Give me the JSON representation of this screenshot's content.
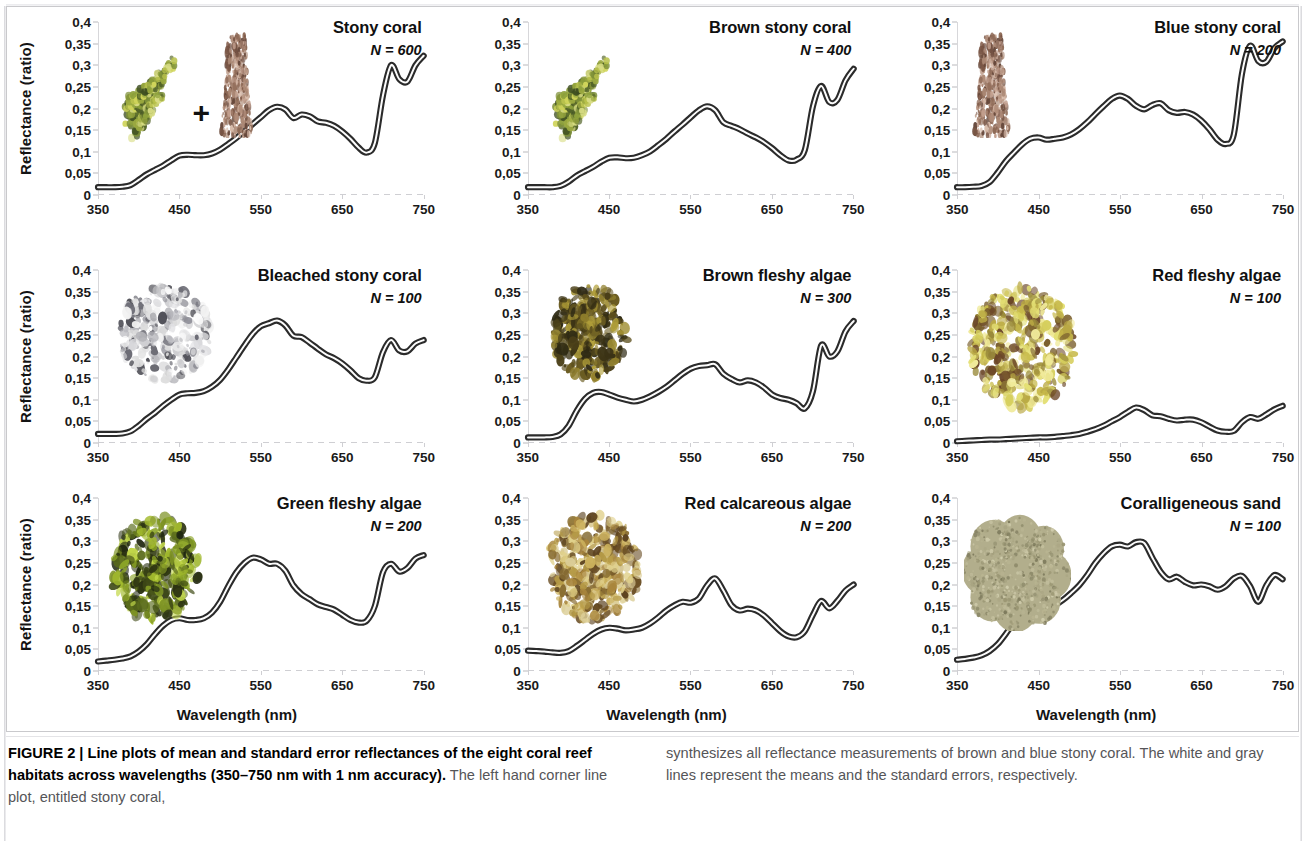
{
  "figure": {
    "axis": {
      "ylabel": "Reflectance (ratio)",
      "xlabel": "Wavelength (nm)",
      "yticks": [
        "0",
        "0,05",
        "0,1",
        "0,15",
        "0,2",
        "0,25",
        "0,3",
        "0,35",
        "0,4"
      ],
      "xticks": [
        "350",
        "450",
        "550",
        "650",
        "750"
      ],
      "ylim": [
        0,
        0.4
      ],
      "xlim": [
        350,
        750
      ]
    },
    "panels": [
      {
        "id": "stony-coral",
        "title": "Stony coral",
        "n_label": "N = 600",
        "thumb": "stony-coral-pair-photo",
        "plus": "+"
      },
      {
        "id": "brown-stony-coral",
        "title": "Brown stony coral",
        "n_label": "N = 400",
        "thumb": "brown-stony-coral-photo"
      },
      {
        "id": "blue-stony-coral",
        "title": "Blue stony coral",
        "n_label": "N = 200",
        "thumb": "blue-stony-coral-photo"
      },
      {
        "id": "bleached-stony-coral",
        "title": "Bleached stony coral",
        "n_label": "N = 100",
        "thumb": "bleached-stony-coral-photo"
      },
      {
        "id": "brown-fleshy-algae",
        "title": "Brown fleshy algae",
        "n_label": "N = 300",
        "thumb": "brown-fleshy-algae-photo"
      },
      {
        "id": "red-fleshy-algae",
        "title": "Red fleshy algae",
        "n_label": "N = 100",
        "thumb": "red-fleshy-algae-photo"
      },
      {
        "id": "green-fleshy-algae",
        "title": "Green fleshy algae",
        "n_label": "N = 200",
        "thumb": "green-fleshy-algae-photo"
      },
      {
        "id": "red-calcareous-algae",
        "title": "Red calcareous algae",
        "n_label": "N = 200",
        "thumb": "red-calcareous-algae-photo"
      },
      {
        "id": "coralligeneous-sand",
        "title": "Coralligeneous sand",
        "n_label": "N = 100",
        "thumb": "coralligeneous-sand-photo"
      }
    ]
  },
  "caption": {
    "label": "FIGURE 2 | ",
    "bold": "Line plots of mean and standard error reflectances of the eight coral reef habitats across wavelengths (350–750 nm with 1 nm accuracy).",
    "rest_left": " The left hand corner line plot, entitled stony coral,",
    "right": "synthesizes all reflectance measurements of brown and blue stony coral. The white and gray lines represent the means and the standard errors, respectively."
  },
  "chart_data": {
    "type": "line",
    "title": "Line plots of mean and standard error reflectances of the eight coral reef habitats across wavelengths",
    "xlabel": "Wavelength (nm)",
    "ylabel": "Reflectance (ratio)",
    "xlim": [
      350,
      750
    ],
    "ylim": [
      0,
      0.4
    ],
    "xticks": [
      350,
      450,
      550,
      650,
      750
    ],
    "yticks": [
      0,
      0.05,
      0.1,
      0.15,
      0.2,
      0.25,
      0.3,
      0.35,
      0.4
    ],
    "grid": false,
    "legend": "none",
    "x": [
      350,
      360,
      370,
      380,
      390,
      400,
      410,
      420,
      430,
      440,
      450,
      460,
      470,
      480,
      490,
      500,
      510,
      520,
      530,
      540,
      550,
      560,
      570,
      580,
      590,
      600,
      610,
      620,
      630,
      640,
      650,
      660,
      670,
      680,
      690,
      700,
      710,
      720,
      730,
      740,
      750
    ],
    "series": [
      {
        "name": "Stony coral",
        "n": 600,
        "values": [
          0.018,
          0.018,
          0.018,
          0.019,
          0.023,
          0.035,
          0.048,
          0.058,
          0.068,
          0.08,
          0.091,
          0.093,
          0.092,
          0.092,
          0.096,
          0.105,
          0.118,
          0.132,
          0.148,
          0.164,
          0.18,
          0.196,
          0.204,
          0.198,
          0.178,
          0.186,
          0.182,
          0.17,
          0.167,
          0.16,
          0.147,
          0.13,
          0.11,
          0.098,
          0.12,
          0.23,
          0.3,
          0.268,
          0.262,
          0.3,
          0.322
        ]
      },
      {
        "name": "Brown stony coral",
        "n": 400,
        "values": [
          0.018,
          0.018,
          0.018,
          0.018,
          0.021,
          0.031,
          0.045,
          0.055,
          0.065,
          0.077,
          0.086,
          0.087,
          0.085,
          0.086,
          0.092,
          0.101,
          0.115,
          0.13,
          0.147,
          0.163,
          0.18,
          0.196,
          0.205,
          0.196,
          0.168,
          0.16,
          0.152,
          0.142,
          0.133,
          0.122,
          0.108,
          0.092,
          0.08,
          0.082,
          0.104,
          0.205,
          0.252,
          0.215,
          0.22,
          0.265,
          0.292
        ]
      },
      {
        "name": "Blue stony coral",
        "n": 200,
        "values": [
          0.018,
          0.018,
          0.019,
          0.021,
          0.03,
          0.052,
          0.078,
          0.098,
          0.117,
          0.13,
          0.133,
          0.128,
          0.13,
          0.133,
          0.14,
          0.152,
          0.168,
          0.187,
          0.205,
          0.222,
          0.23,
          0.222,
          0.206,
          0.198,
          0.208,
          0.212,
          0.196,
          0.19,
          0.192,
          0.186,
          0.172,
          0.152,
          0.128,
          0.118,
          0.14,
          0.28,
          0.345,
          0.31,
          0.308,
          0.34,
          0.355
        ]
      },
      {
        "name": "Bleached stony coral",
        "n": 100,
        "values": [
          0.021,
          0.021,
          0.021,
          0.022,
          0.027,
          0.04,
          0.056,
          0.07,
          0.086,
          0.1,
          0.112,
          0.115,
          0.116,
          0.12,
          0.13,
          0.146,
          0.17,
          0.198,
          0.226,
          0.252,
          0.27,
          0.277,
          0.283,
          0.272,
          0.248,
          0.245,
          0.232,
          0.218,
          0.205,
          0.196,
          0.184,
          0.168,
          0.15,
          0.144,
          0.152,
          0.21,
          0.238,
          0.214,
          0.212,
          0.23,
          0.238
        ]
      },
      {
        "name": "Brown fleshy algae",
        "n": 300,
        "values": [
          0.013,
          0.013,
          0.013,
          0.014,
          0.02,
          0.04,
          0.075,
          0.102,
          0.116,
          0.118,
          0.112,
          0.105,
          0.1,
          0.096,
          0.1,
          0.108,
          0.118,
          0.13,
          0.145,
          0.16,
          0.172,
          0.178,
          0.18,
          0.182,
          0.16,
          0.148,
          0.14,
          0.145,
          0.14,
          0.128,
          0.112,
          0.104,
          0.1,
          0.092,
          0.08,
          0.12,
          0.225,
          0.2,
          0.212,
          0.258,
          0.282
        ]
      },
      {
        "name": "Red fleshy algae",
        "n": 100,
        "values": [
          0.004,
          0.005,
          0.006,
          0.007,
          0.008,
          0.008,
          0.009,
          0.01,
          0.011,
          0.012,
          0.013,
          0.013,
          0.014,
          0.016,
          0.018,
          0.021,
          0.026,
          0.032,
          0.04,
          0.05,
          0.06,
          0.072,
          0.082,
          0.076,
          0.064,
          0.062,
          0.056,
          0.052,
          0.054,
          0.054,
          0.048,
          0.038,
          0.029,
          0.026,
          0.028,
          0.048,
          0.06,
          0.056,
          0.066,
          0.078,
          0.086
        ]
      },
      {
        "name": "Green fleshy algae",
        "n": 200,
        "values": [
          0.022,
          0.024,
          0.026,
          0.029,
          0.034,
          0.045,
          0.062,
          0.085,
          0.105,
          0.118,
          0.122,
          0.118,
          0.118,
          0.122,
          0.135,
          0.16,
          0.196,
          0.228,
          0.25,
          0.262,
          0.258,
          0.248,
          0.248,
          0.232,
          0.198,
          0.178,
          0.166,
          0.154,
          0.148,
          0.142,
          0.13,
          0.118,
          0.112,
          0.116,
          0.15,
          0.228,
          0.248,
          0.23,
          0.238,
          0.26,
          0.268
        ]
      },
      {
        "name": "Red calcareous algae",
        "n": 200,
        "values": [
          0.047,
          0.046,
          0.045,
          0.043,
          0.042,
          0.046,
          0.058,
          0.072,
          0.086,
          0.096,
          0.1,
          0.098,
          0.094,
          0.096,
          0.1,
          0.11,
          0.124,
          0.14,
          0.152,
          0.16,
          0.158,
          0.168,
          0.198,
          0.214,
          0.186,
          0.152,
          0.14,
          0.144,
          0.14,
          0.128,
          0.11,
          0.092,
          0.08,
          0.078,
          0.092,
          0.13,
          0.162,
          0.145,
          0.162,
          0.186,
          0.2
        ]
      },
      {
        "name": "Coralligeneous sand",
        "n": 100,
        "values": [
          0.026,
          0.028,
          0.031,
          0.036,
          0.046,
          0.062,
          0.086,
          0.112,
          0.134,
          0.146,
          0.147,
          0.146,
          0.152,
          0.164,
          0.18,
          0.198,
          0.222,
          0.25,
          0.272,
          0.288,
          0.292,
          0.288,
          0.298,
          0.296,
          0.262,
          0.23,
          0.212,
          0.218,
          0.206,
          0.198,
          0.2,
          0.196,
          0.188,
          0.196,
          0.214,
          0.22,
          0.196,
          0.16,
          0.198,
          0.222,
          0.212
        ]
      }
    ]
  }
}
